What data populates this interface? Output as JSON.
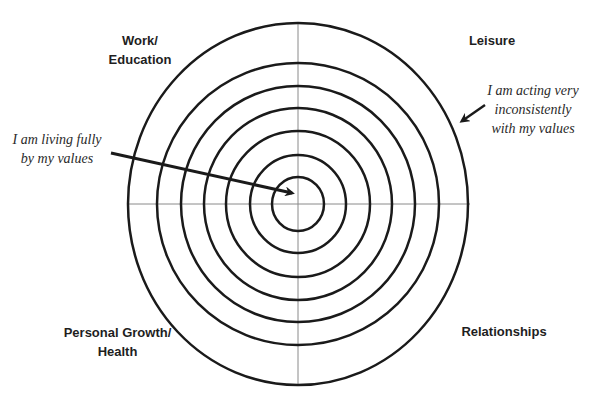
{
  "diagram": {
    "type": "bullseye",
    "center": {
      "x": 298,
      "y": 204
    },
    "rings": [
      {
        "rx": 26,
        "ry": 27
      },
      {
        "rx": 48,
        "ry": 49
      },
      {
        "rx": 72,
        "ry": 73
      },
      {
        "rx": 94,
        "ry": 96
      },
      {
        "rx": 117,
        "ry": 118
      },
      {
        "rx": 141,
        "ry": 141
      },
      {
        "rx": 170,
        "ry": 181
      }
    ],
    "ring_color": "#1a1a1a",
    "axis_color": "#8a8a8a",
    "arrow_color": "#1a1a1a"
  },
  "quadrants": {
    "top_left": {
      "line1": "Work/",
      "line2": "Education"
    },
    "top_right": {
      "line1": "Leisure"
    },
    "bottom_left": {
      "line1": "Personal Growth/",
      "line2": "Health"
    },
    "bottom_right": {
      "line1": "Relationships"
    }
  },
  "annotations": {
    "center": {
      "line1": "I am living fully",
      "line2": "by my values"
    },
    "outer": {
      "line1": "I am acting very",
      "line2": "inconsistently",
      "line3": "with my values"
    }
  }
}
